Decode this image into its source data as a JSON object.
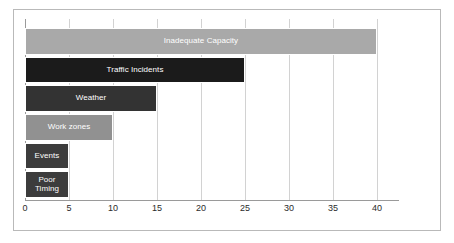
{
  "chart_data": {
    "type": "bar",
    "orientation": "horizontal",
    "title": "",
    "subtitle": "",
    "xlabel": "",
    "ylabel": "",
    "xlim": [
      0,
      42.5
    ],
    "xticks": [
      0,
      5,
      10,
      15,
      20,
      25,
      30,
      35,
      40
    ],
    "grid": true,
    "legend": false,
    "categories": [
      "Inadequate Capacity",
      "Traffic Incidents",
      "Weather",
      "Work zones",
      "Events",
      "Poor\nTiming"
    ],
    "values": [
      40,
      25,
      15,
      10,
      5,
      5
    ],
    "series": [
      {
        "name": "",
        "values": [
          40,
          25,
          15,
          10,
          5,
          5
        ]
      }
    ],
    "bar_colors": [
      "#a9a9a9",
      "#1b1b1b",
      "#333333",
      "#919191",
      "#3c3c3c",
      "#3c3c3c"
    ],
    "label_color": "#ffffff",
    "gridline_color": "#d2d2d2",
    "axis_color": "#9a9a9a",
    "frame_color": "#b9b9b9",
    "background_color": "#ffffff",
    "bars": [
      {
        "label": "Inadequate Capacity",
        "value": 40,
        "color": "#a9a9a9"
      },
      {
        "label": "Traffic Incidents",
        "value": 25,
        "color": "#1b1b1b"
      },
      {
        "label": "Weather",
        "value": 15,
        "color": "#333333"
      },
      {
        "label": "Work zones",
        "value": 10,
        "color": "#919191"
      },
      {
        "label": "Events",
        "value": 5,
        "color": "#3c3c3c"
      },
      {
        "label": "Poor\nTiming",
        "value": 5,
        "color": "#3c3c3c"
      }
    ],
    "tick_labels": [
      "0",
      "5",
      "10",
      "15",
      "20",
      "25",
      "30",
      "35",
      "40"
    ]
  }
}
